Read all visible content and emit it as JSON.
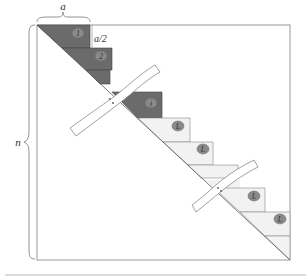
{
  "labels": {
    "width": "a",
    "half_height": "a/2",
    "count": "n"
  },
  "steps": [
    {
      "label": "1",
      "shade": "dark"
    },
    {
      "label": "2",
      "shade": "dark"
    },
    {
      "label": "i",
      "shade": "dark"
    },
    {
      "label": "L",
      "shade": "light"
    },
    {
      "label": "L",
      "shade": "light"
    },
    {
      "label": "L",
      "shade": "light"
    },
    {
      "label": "L",
      "shade": "light"
    }
  ],
  "colors": {
    "dark_step": "#6b6b6b",
    "light_step": "#f2f2f2",
    "frame": "#888888",
    "badge": "#8a8a8a"
  }
}
